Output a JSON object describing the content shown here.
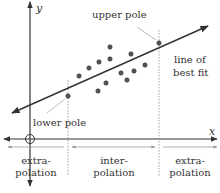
{
  "labels": {
    "y_axis": "y",
    "x_axis": "x",
    "upper_pole": "upper pole",
    "lower_pole": "lower pole",
    "best_fit_1": "line of",
    "best_fit_2": "best fit",
    "left_extra_1": "extra-",
    "left_extra_2": "polation",
    "inter_1": "inter-",
    "inter_2": "polation",
    "right_extra_1": "extra-",
    "right_extra_2": "polation"
  },
  "colors": {
    "line": "#333333",
    "point_fill": "#555555",
    "guide": "#888888"
  },
  "points": [
    [
      110,
      47
    ],
    [
      159,
      43
    ],
    [
      79,
      76
    ],
    [
      89,
      68
    ],
    [
      99,
      62
    ],
    [
      110,
      59
    ],
    [
      131,
      54
    ],
    [
      121,
      73
    ],
    [
      134,
      71
    ],
    [
      145,
      65
    ],
    [
      127,
      80
    ],
    [
      106,
      83
    ],
    [
      98,
      91
    ],
    [
      68,
      96
    ]
  ]
}
